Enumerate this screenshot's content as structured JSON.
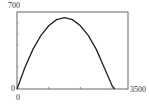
{
  "chart_data": {
    "type": "line",
    "title": "",
    "xlabel": "",
    "ylabel": "",
    "xlim": [
      0,
      3500
    ],
    "ylim": [
      0,
      700
    ],
    "tick_labels": {
      "ymax": "700",
      "ymin": "0",
      "xmin": "0",
      "xmax": "3500"
    },
    "x_ticks": [
      1000,
      2000,
      3000
    ],
    "y_ticks": [
      100,
      200,
      300,
      400,
      500,
      600
    ],
    "grid": false,
    "series": [
      {
        "name": "curve",
        "x": [
          0,
          250,
          500,
          750,
          1000,
          1250,
          1500,
          1750,
          2000,
          2250,
          2500,
          2750,
          3000,
          3080
        ],
        "values": [
          0,
          195,
          360,
          485,
          575,
          630,
          648,
          630,
          575,
          485,
          360,
          195,
          30,
          0
        ]
      }
    ],
    "colors": {
      "frame": "#555555",
      "curve": "#222222"
    }
  }
}
